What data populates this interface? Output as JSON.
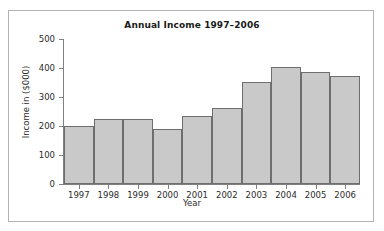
{
  "chart_data": {
    "type": "bar",
    "title": "Annual Income 1997–2006",
    "xlabel": "Year",
    "ylabel": "Income in ($000)",
    "categories": [
      "1997",
      "1998",
      "1999",
      "2000",
      "2001",
      "2002",
      "2003",
      "2004",
      "2005",
      "2006"
    ],
    "values": [
      200,
      225,
      225,
      190,
      235,
      262,
      352,
      403,
      385,
      372
    ],
    "ylim": [
      0,
      500
    ],
    "ytick_labels": [
      "0",
      "100",
      "200",
      "300",
      "400",
      "500"
    ],
    "ytick_values": [
      0,
      100,
      200,
      300,
      400,
      500
    ],
    "grid": false,
    "legend": "none",
    "bar_fill_color": "#c9c9c9",
    "bar_border_color": "#6e6e6e",
    "axis_color": "#808080",
    "frame_border_color": "#b3b3b3",
    "background_color": "#ffffff",
    "text_color": "#2b2b2b"
  }
}
